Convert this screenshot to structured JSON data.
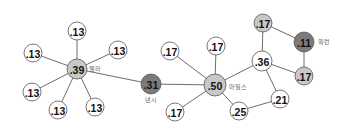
{
  "diagram": {
    "colors": {
      "white": "#ffffff",
      "light": "#c8c8c8",
      "dark": "#7b7b7b",
      "edge": "#6e6e6e"
    },
    "nodes": [
      {
        "id": "n_ella",
        "value": ".39",
        "label": "엘라",
        "x": 77,
        "y": 69,
        "r": 10,
        "fill": "light",
        "label_dx": 12,
        "label_dy": 2
      },
      {
        "id": "n_e1",
        "value": ".13",
        "x": 77,
        "y": 31,
        "r": 9,
        "fill": "white"
      },
      {
        "id": "n_e2",
        "value": ".13",
        "x": 33,
        "y": 53,
        "r": 9,
        "fill": "white"
      },
      {
        "id": "n_e3",
        "value": ".13",
        "x": 118,
        "y": 50,
        "r": 9,
        "fill": "white"
      },
      {
        "id": "n_e4",
        "value": ".13",
        "x": 32,
        "y": 92,
        "r": 9,
        "fill": "white"
      },
      {
        "id": "n_e5",
        "value": ".13",
        "x": 58,
        "y": 110,
        "r": 9,
        "fill": "white"
      },
      {
        "id": "n_e6",
        "value": ".13",
        "x": 95,
        "y": 107,
        "r": 9,
        "fill": "white"
      },
      {
        "id": "n_nancy",
        "value": ".31",
        "label": "낸시",
        "x": 151,
        "y": 84,
        "r": 10,
        "fill": "dark",
        "label_dx": -6,
        "label_dy": 18
      },
      {
        "id": "n_miles",
        "value": ".50",
        "label": "마일스",
        "x": 215,
        "y": 85,
        "r": 11,
        "fill": "light",
        "label_dx": 14,
        "label_dy": 4
      },
      {
        "id": "n_m1",
        "value": ".17",
        "x": 170,
        "y": 51,
        "r": 9,
        "fill": "white"
      },
      {
        "id": "n_m2",
        "value": ".17",
        "x": 216,
        "y": 46,
        "r": 9,
        "fill": "white"
      },
      {
        "id": "n_m3",
        "value": ".17",
        "x": 175,
        "y": 112,
        "r": 9,
        "fill": "white"
      },
      {
        "id": "n_25",
        "value": ".25",
        "x": 239,
        "y": 111,
        "r": 9,
        "fill": "white"
      },
      {
        "id": "n_36",
        "value": ".36",
        "x": 262,
        "y": 61,
        "r": 10,
        "fill": "white"
      },
      {
        "id": "n_21",
        "value": ".21",
        "x": 280,
        "y": 99,
        "r": 9,
        "fill": "white"
      },
      {
        "id": "n_t17",
        "value": ".17",
        "x": 263,
        "y": 23,
        "r": 9,
        "fill": "light"
      },
      {
        "id": "n_warren",
        "value": ".11",
        "label": "워런",
        "x": 304,
        "y": 42,
        "r": 10,
        "fill": "dark",
        "label_dx": 14,
        "label_dy": 2
      },
      {
        "id": "n_r17",
        "value": ".17",
        "x": 304,
        "y": 76,
        "r": 9,
        "fill": "light"
      }
    ],
    "edges": [
      [
        "n_ella",
        "n_e1"
      ],
      [
        "n_ella",
        "n_e2"
      ],
      [
        "n_ella",
        "n_e3"
      ],
      [
        "n_ella",
        "n_e4"
      ],
      [
        "n_ella",
        "n_e5"
      ],
      [
        "n_ella",
        "n_e6"
      ],
      [
        "n_ella",
        "n_nancy"
      ],
      [
        "n_nancy",
        "n_miles"
      ],
      [
        "n_miles",
        "n_m1"
      ],
      [
        "n_miles",
        "n_m2"
      ],
      [
        "n_miles",
        "n_m3"
      ],
      [
        "n_miles",
        "n_25"
      ],
      [
        "n_miles",
        "n_36"
      ],
      [
        "n_25",
        "n_21"
      ],
      [
        "n_36",
        "n_21"
      ],
      [
        "n_36",
        "n_t17"
      ],
      [
        "n_36",
        "n_r17"
      ],
      [
        "n_t17",
        "n_warren"
      ],
      [
        "n_warren",
        "n_r17"
      ]
    ]
  }
}
